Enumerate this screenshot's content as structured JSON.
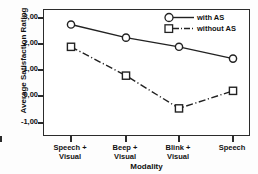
{
  "chart_data": {
    "type": "line",
    "title": "",
    "xlabel": "Modality",
    "ylabel": "Average Satisfaction Rating",
    "categories": [
      "Speech +\nVisual",
      "Beep +\nVisual",
      "Blink +\nVisual",
      "Speech"
    ],
    "category_lines": [
      [
        "Speech +",
        "Visual"
      ],
      [
        "Beep +",
        "Visual"
      ],
      [
        "Blink +",
        "Visual"
      ],
      [
        "Speech",
        ""
      ]
    ],
    "ylim": [
      -1.0,
      3.2
    ],
    "yticks": [
      3.0,
      2.0,
      1.0,
      0.0,
      -1.0
    ],
    "ytick_labels": [
      "3,00",
      "2,00",
      "1,00",
      "0,00",
      "-1,00"
    ],
    "grid": false,
    "legend_position": "top-right",
    "series": [
      {
        "name": "with AS",
        "marker": "circle",
        "line_style": "solid",
        "color": "#222222",
        "values": [
          2.75,
          2.25,
          1.9,
          1.45
        ]
      },
      {
        "name": "without AS",
        "marker": "square",
        "line_style": "dashdot",
        "color": "#222222",
        "values": [
          1.9,
          0.8,
          -0.45,
          0.22
        ]
      }
    ]
  },
  "legend": {
    "items": [
      {
        "label": "with AS"
      },
      {
        "label": "without AS"
      }
    ]
  },
  "axes": {
    "y_title": "Average Satisfaction Rating",
    "x_title": "Modality"
  }
}
